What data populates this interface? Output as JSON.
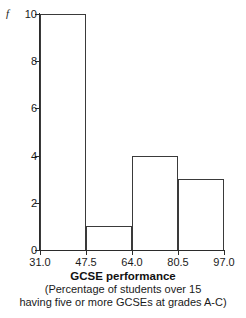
{
  "chart_data": {
    "type": "bar",
    "title": "GCSE performance",
    "subtitle_lines": [
      "(Percentage of students over 15",
      "having five or more GCSEs at grades A-C)"
    ],
    "xlabel": "GCSE performance",
    "ylabel": "f",
    "categories": [
      "31.0–47.5",
      "47.5–64.0",
      "64.0–80.5",
      "80.5–97.0"
    ],
    "bin_edges": [
      31.0,
      47.5,
      64.0,
      80.5,
      97.0
    ],
    "values": [
      10,
      1,
      4,
      3
    ],
    "xlim": [
      31.0,
      97.0
    ],
    "ylim": [
      0,
      10
    ],
    "xticks": [
      "31.0",
      "47.5",
      "64.0",
      "80.5",
      "97.0"
    ],
    "xtick_values": [
      31.0,
      47.5,
      64.0,
      80.5,
      97.0
    ],
    "yticks": [
      "0",
      "2",
      "4",
      "6",
      "8",
      "10"
    ],
    "ytick_values": [
      0,
      2,
      4,
      6,
      8,
      10
    ],
    "grid": false,
    "legend": "none",
    "bar_fill": "#ffffff",
    "bar_edge_color": "#3a3a3a",
    "axis_color": "#2b2b2b",
    "background": "#ffffff"
  }
}
